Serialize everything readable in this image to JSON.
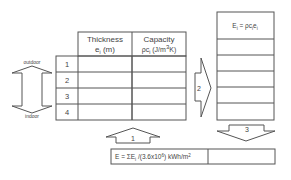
{
  "left_table": {
    "headers": [
      {
        "line1": "Thickness",
        "line2": "e",
        "line2_sub": "i",
        "line2_tail": " (m)"
      },
      {
        "line1": "Capacity",
        "line2": "ρc",
        "line2_sub": "i",
        "line2_tail": " (J/m",
        "line2_sup": "3",
        "line2_end": "K)"
      }
    ],
    "rows": [
      "1",
      "2",
      "3",
      "4"
    ]
  },
  "side_labels": {
    "top": "outdoor",
    "bottom": "indoor"
  },
  "right_table": {
    "header": {
      "lhs": "E",
      "lhs_sub": "i",
      "rhs": " = ρc",
      "rhs_sub": "i",
      "rhs2": "e",
      "rhs2_sub": "i"
    },
    "row_count": 5
  },
  "arrows": {
    "step1": "1",
    "step2": "2",
    "step3": "3"
  },
  "formula": {
    "text_a": "E = ΣE",
    "sub": "i",
    "text_b": " /(3.6x10",
    "sup": "6",
    "text_c": ") kWh/m",
    "sup2": "2"
  }
}
